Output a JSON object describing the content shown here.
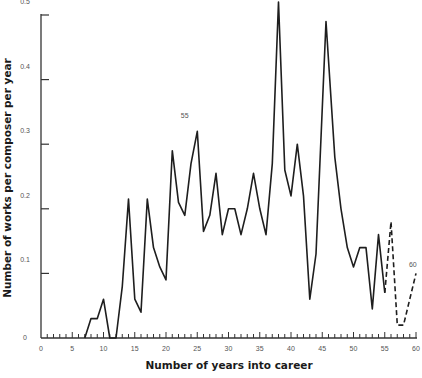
{
  "chart_data": {
    "type": "line",
    "title": "",
    "xlabel": "Number of years into career",
    "ylabel": "Number of works per composer per year",
    "xlim": [
      0,
      60
    ],
    "ylim": [
      0,
      0.5
    ],
    "x_ticks": [
      0,
      5,
      10,
      15,
      20,
      25,
      30,
      35,
      40,
      45,
      50,
      55,
      60
    ],
    "x_tick_labels": [
      "0",
      "5",
      "10",
      "15",
      "20",
      "25",
      "30",
      "35",
      "40",
      "45",
      "50",
      "55",
      "60"
    ],
    "y_ticks": [
      0,
      0.1,
      0.2,
      0.3,
      0.4,
      0.5
    ],
    "y_tick_labels": [
      "0",
      "0.1",
      "0.2",
      "0.3",
      "0.4",
      "0.5"
    ],
    "grid": false,
    "legend": null,
    "series": [
      {
        "name": "solid",
        "style": "solid",
        "x": [
          7,
          8,
          9,
          10,
          11,
          12,
          13,
          14,
          15,
          16,
          17,
          18,
          19,
          20,
          21,
          22,
          23,
          24,
          25,
          26,
          27,
          28,
          29,
          30,
          31,
          32,
          33,
          34,
          35,
          36,
          37,
          38,
          39,
          40,
          41,
          42,
          43,
          44,
          45.6,
          47,
          48,
          49,
          50,
          51,
          52,
          53,
          54,
          55
        ],
        "values": [
          0,
          0.03,
          0.03,
          0.06,
          0,
          0,
          0.08,
          0.215,
          0.06,
          0.04,
          0.215,
          0.14,
          0.11,
          0.09,
          0.29,
          0.21,
          0.19,
          0.27,
          0.32,
          0.165,
          0.19,
          0.255,
          0.16,
          0.2,
          0.2,
          0.16,
          0.2,
          0.255,
          0.2,
          0.16,
          0.27,
          0.52,
          0.26,
          0.22,
          0.3,
          0.22,
          0.06,
          0.13,
          0.49,
          0.28,
          0.2,
          0.14,
          0.11,
          0.14,
          0.14,
          0.045,
          0.16,
          0.07
        ]
      },
      {
        "name": "dashed",
        "style": "dashed",
        "x": [
          55,
          56,
          57,
          58,
          60
        ],
        "values": [
          0.07,
          0.18,
          0.02,
          0.02,
          0.1
        ]
      }
    ],
    "annotations": [
      {
        "text": "55",
        "x": 23,
        "y": 0.34
      },
      {
        "text": "60",
        "x": 59.5,
        "y": 0.11
      }
    ]
  }
}
